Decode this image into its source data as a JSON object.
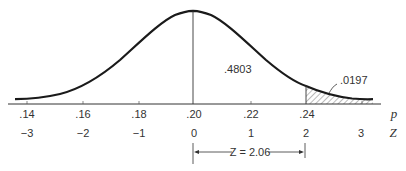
{
  "diagram": {
    "type": "normal-distribution-curve",
    "center_area_label": ".4803",
    "tail_area_label": ".0197",
    "p_axis": {
      "symbol": "p",
      "ticks": [
        ".14",
        ".16",
        ".18",
        ".20",
        ".22",
        ".24"
      ]
    },
    "z_axis": {
      "symbol": "Z",
      "ticks": [
        "−3",
        "−2",
        "−1",
        "0",
        "1",
        "2",
        "3"
      ]
    },
    "bracket_label": "Z = 2.06",
    "colors": {
      "curve": "#1a1a1a",
      "axis": "#333333",
      "hatch": "#555555",
      "text": "#333333"
    }
  }
}
